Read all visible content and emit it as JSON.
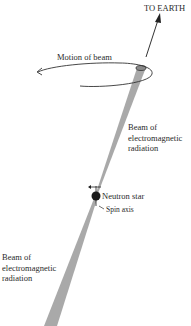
{
  "labels": {
    "to_earth": "TO EARTH",
    "motion_of_beam": "Motion of beam",
    "beam_upper": [
      "Beam of",
      "electromagnetic",
      "radiation"
    ],
    "neutron_star": "Neutron star",
    "spin_axis": "Spin axis",
    "beam_lower": [
      "Beam of",
      "electromagnetic",
      "radiation"
    ]
  },
  "colors": {
    "beam": "#a9a9a9",
    "star": "#1a1a1a",
    "line": "#333333"
  }
}
